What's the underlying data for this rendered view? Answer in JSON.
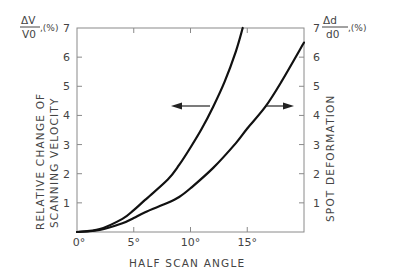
{
  "chart_data": {
    "type": "line",
    "title": "",
    "xlabel": "HALF SCAN ANGLE",
    "ylabel_left": "RELATIVE CHANGE OF SCANNING VELOCITY",
    "ylabel_right": "SPOT DEFORMATION",
    "left_unit": {
      "numerator": "ΔV",
      "denominator": "V0",
      "suffix": ",(%)"
    },
    "right_unit": {
      "numerator": "Δd",
      "denominator": "d0",
      "suffix": ",(%)"
    },
    "xlim": [
      0,
      20
    ],
    "ylim": [
      0,
      7
    ],
    "x_ticks": [
      "0°",
      "5°",
      "10°",
      "15°"
    ],
    "y_ticks_left": [
      "1",
      "2",
      "3",
      "4",
      "5",
      "6",
      "7"
    ],
    "y_ticks_right": [
      "1",
      "2",
      "3",
      "4",
      "5",
      "6",
      "7"
    ],
    "grid": false,
    "series": [
      {
        "name": "Relative change of scanning velocity (left axis)",
        "axis": "left",
        "x": [
          0,
          2,
          4,
          5,
          6,
          8,
          9,
          10,
          11,
          12,
          13,
          14,
          14.6
        ],
        "y": [
          0,
          0.1,
          0.45,
          0.75,
          1.1,
          1.8,
          2.3,
          2.9,
          3.55,
          4.3,
          5.15,
          6.2,
          7.0
        ]
      },
      {
        "name": "Spot deformation (right axis)",
        "axis": "right",
        "x": [
          0,
          2,
          4,
          5,
          6,
          8,
          9,
          10,
          12,
          14,
          15,
          16.6,
          18,
          20
        ],
        "y": [
          0,
          0.07,
          0.3,
          0.48,
          0.68,
          1.0,
          1.2,
          1.5,
          2.2,
          3.05,
          3.55,
          4.3,
          5.15,
          6.5
        ]
      }
    ],
    "annotations": [
      {
        "type": "arrow",
        "direction": "left",
        "meaning": "steeper curve refers to left axis",
        "y": 4.3
      },
      {
        "type": "arrow",
        "direction": "right",
        "meaning": "flatter curve refers to right axis",
        "y": 4.3
      }
    ],
    "legend": "none"
  },
  "colors": {
    "curve": "#111111",
    "axis": "#777777",
    "text": "#444444"
  }
}
